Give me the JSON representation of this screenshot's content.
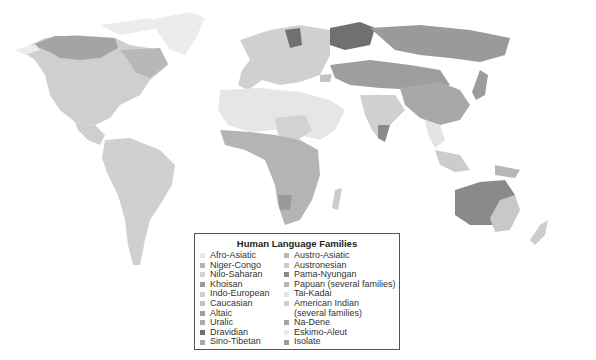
{
  "map": {
    "title": "Human Language Families",
    "regions_colors": {
      "ocean": "#ffffff",
      "land_default": "#d3d3d3"
    }
  },
  "legend": {
    "title": "Human Language Families",
    "left_column": [
      {
        "label": "Afro-Asiatic",
        "color": "#e6e6e6"
      },
      {
        "label": "Niger-Congo",
        "color": "#b4b4b4"
      },
      {
        "label": "Nilo-Saharan",
        "color": "#d2d2d2"
      },
      {
        "label": "Khoisan",
        "color": "#9a9a9a"
      },
      {
        "label": "Indo-European",
        "color": "#d0d0d0"
      },
      {
        "label": "Caucasian",
        "color": "#c2c2c2"
      },
      {
        "label": "Altaic",
        "color": "#9e9e9e"
      },
      {
        "label": "Uralic",
        "color": "#aaaaaa"
      },
      {
        "label": "Dravidian",
        "color": "#707070"
      },
      {
        "label": "Sino-Tibetan",
        "color": "#a8a8a8"
      }
    ],
    "right_column": [
      {
        "label": "Austro-Asiatic",
        "color": "#b8b8b8"
      },
      {
        "label": "Austronesian",
        "color": "#cccccc"
      },
      {
        "label": "Pama-Nyungan",
        "color": "#8a8a8a"
      },
      {
        "label": "Papuan (several families)",
        "color": "#b6b6b6"
      },
      {
        "label": "Tai-Kadai",
        "color": "#e4e4e4"
      },
      {
        "label": "American Indian",
        "color": "#cfcfcf"
      },
      {
        "label": "(several families)",
        "color": null
      },
      {
        "label": "Na-Dene",
        "color": "#a4a4a4"
      },
      {
        "label": "Eskimo-Aleut",
        "color": "#ececec"
      },
      {
        "label": "Isolate",
        "color": "#9c9c9c"
      }
    ]
  }
}
